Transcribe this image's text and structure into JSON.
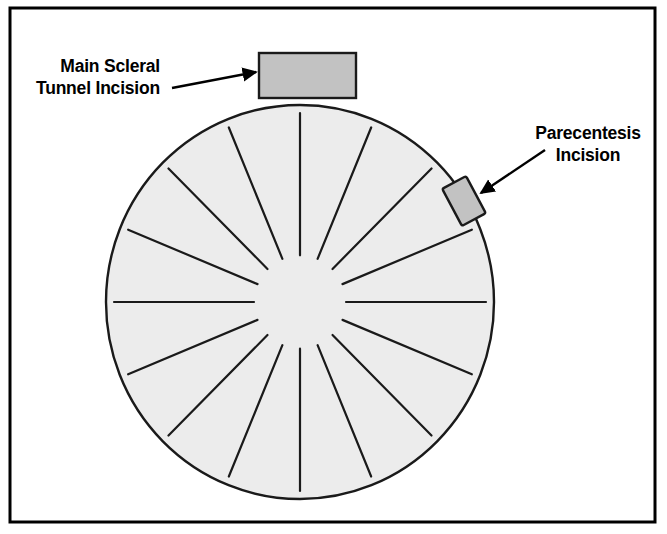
{
  "figure": {
    "background_color": "#ffffff",
    "border": {
      "name": "figure-border",
      "x": 10,
      "y": 8,
      "width": 645,
      "height": 514,
      "stroke": "#000000",
      "stroke_width": 3,
      "fill": "#ffffff"
    }
  },
  "cornea": {
    "name": "cornea-circle",
    "cx": 300,
    "cy": 302,
    "rx": 194,
    "ry": 197,
    "fill": "#ececec",
    "stroke": "#1a1a1a",
    "stroke_width": 2.4
  },
  "radial_incisions": {
    "count": 16,
    "angle_step_deg": 22.5,
    "inner_radius": 46,
    "outer_radius": 186,
    "stroke": "#1a1a1a",
    "stroke_width": 2.2,
    "angles_deg": [
      0,
      22.5,
      45,
      67.5,
      90,
      112.5,
      135,
      157.5,
      180,
      202.5,
      225,
      247.5,
      270,
      292.5,
      315,
      337.5
    ]
  },
  "main_incision": {
    "name": "main-scleral-tunnel-incision-marker",
    "x": 259,
    "y": 53,
    "width": 97,
    "height": 45,
    "fill": "#c2c2c2",
    "stroke": "#1a1a1a",
    "stroke_width": 2.4
  },
  "parecentesis_incision": {
    "name": "parecentesis-incision-marker",
    "cx": 464,
    "cy": 201,
    "width": 27,
    "height": 42,
    "rotation_deg": -28,
    "fill": "#c2c2c2",
    "stroke": "#1a1a1a",
    "stroke_width": 2.4
  },
  "labels": {
    "main_incision": {
      "name": "main-scleral-tunnel-incision-label",
      "line1": "Main Scleral",
      "line2": "Tunnel Incision",
      "x": 160,
      "y1": 72,
      "y2": 94,
      "anchor": "end",
      "color": "#000000"
    },
    "parecentesis": {
      "name": "parecentesis-incision-label",
      "line1": "Parecentesis",
      "line2": "Incision",
      "x": 588,
      "y1": 139,
      "y2": 161,
      "anchor": "middle",
      "color": "#000000"
    }
  },
  "arrows": {
    "main_incision": {
      "name": "main-incision-arrow",
      "x1": 172,
      "y1": 88,
      "x2": 256,
      "y2": 72,
      "stroke": "#000000",
      "stroke_width": 2.4
    },
    "parecentesis": {
      "name": "parecentesis-arrow",
      "x1": 545,
      "y1": 150,
      "x2": 481,
      "y2": 193,
      "stroke": "#000000",
      "stroke_width": 2.4
    }
  }
}
